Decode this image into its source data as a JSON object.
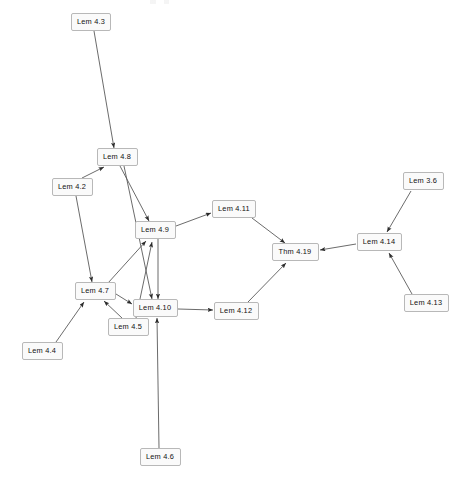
{
  "diagram": {
    "type": "directed-graph",
    "background_color": "#ffffff",
    "node_fill": "#fafafa",
    "node_stroke": "#b8b8b8",
    "edge_color": "#5a5a5a",
    "text_color": "#111111",
    "width": 458,
    "height": 485,
    "nodes": [
      {
        "id": "lem-4-3",
        "label": "Lem 4.3",
        "x": 91,
        "y": 22,
        "w": 40,
        "h": 18
      },
      {
        "id": "lem-4-8",
        "label": "Lem 4.8",
        "x": 117,
        "y": 157,
        "w": 41,
        "h": 18
      },
      {
        "id": "lem-4-2",
        "label": "Lem 4.2",
        "x": 72,
        "y": 187,
        "w": 41,
        "h": 18
      },
      {
        "id": "lem-4-9",
        "label": "Lem 4.9",
        "x": 155,
        "y": 230,
        "w": 41,
        "h": 18
      },
      {
        "id": "lem-4-11",
        "label": "Lem 4.11",
        "x": 234,
        "y": 209,
        "w": 44,
        "h": 18
      },
      {
        "id": "lem-4-7",
        "label": "Lem 4.7",
        "x": 95,
        "y": 291,
        "w": 41,
        "h": 18
      },
      {
        "id": "lem-4-10",
        "label": "Lem 4.10",
        "x": 155,
        "y": 308,
        "w": 45,
        "h": 18
      },
      {
        "id": "lem-4-5",
        "label": "Lem 4.5",
        "x": 128,
        "y": 327,
        "w": 41,
        "h": 18
      },
      {
        "id": "lem-4-12",
        "label": "Lem 4.12",
        "x": 236,
        "y": 311,
        "w": 45,
        "h": 18
      },
      {
        "id": "thm-4-19",
        "label": "Thm 4.19",
        "x": 295,
        "y": 252,
        "w": 47,
        "h": 18
      },
      {
        "id": "lem-4-14",
        "label": "Lem 4.14",
        "x": 379,
        "y": 242,
        "w": 45,
        "h": 18
      },
      {
        "id": "lem-3-6",
        "label": "Lem 3.6",
        "x": 423,
        "y": 181,
        "w": 41,
        "h": 18
      },
      {
        "id": "lem-4-13",
        "label": "Lem 4.13",
        "x": 426,
        "y": 303,
        "w": 45,
        "h": 18
      },
      {
        "id": "lem-4-4",
        "label": "Lem 4.4",
        "x": 42,
        "y": 351,
        "w": 41,
        "h": 18
      },
      {
        "id": "lem-4-6",
        "label": "Lem 4.6",
        "x": 160,
        "y": 457,
        "w": 41,
        "h": 18
      }
    ],
    "edges": [
      {
        "from": "lem-4-3",
        "to": "lem-4-8",
        "x1": 94,
        "y1": 31,
        "x2": 114,
        "y2": 148
      },
      {
        "from": "lem-4-2",
        "to": "lem-4-8",
        "x1": 82,
        "y1": 178,
        "x2": 104,
        "y2": 167
      },
      {
        "from": "lem-4-2",
        "to": "lem-4-7",
        "x1": 76,
        "y1": 196,
        "x2": 92,
        "y2": 282
      },
      {
        "from": "lem-4-8",
        "to": "lem-4-9",
        "x1": 120,
        "y1": 166,
        "x2": 149,
        "y2": 221
      },
      {
        "from": "lem-4-8",
        "to": "lem-4-10",
        "x1": 124,
        "y1": 166,
        "x2": 152,
        "y2": 299
      },
      {
        "from": "lem-4-9",
        "to": "lem-4-11",
        "x1": 176,
        "y1": 226,
        "x2": 211,
        "y2": 213
      },
      {
        "from": "lem-4-9",
        "to": "lem-4-10",
        "x1": 158,
        "y1": 239,
        "x2": 158,
        "y2": 299
      },
      {
        "from": "lem-4-11",
        "to": "thm-4-19",
        "x1": 252,
        "y1": 218,
        "x2": 285,
        "y2": 243
      },
      {
        "from": "lem-4-7",
        "to": "lem-4-9",
        "x1": 108,
        "y1": 283,
        "x2": 146,
        "y2": 241
      },
      {
        "from": "lem-4-7",
        "to": "lem-4-10",
        "x1": 116,
        "y1": 294,
        "x2": 132,
        "y2": 304
      },
      {
        "from": "lem-4-5",
        "to": "lem-4-7",
        "x1": 122,
        "y1": 318,
        "x2": 104,
        "y2": 301
      },
      {
        "from": "lem-4-5",
        "to": "lem-4-9",
        "x1": 136,
        "y1": 318,
        "x2": 152,
        "y2": 242
      },
      {
        "from": "lem-4-4",
        "to": "lem-4-7",
        "x1": 56,
        "y1": 342,
        "x2": 84,
        "y2": 302
      },
      {
        "from": "lem-4-6",
        "to": "lem-4-10",
        "x1": 159,
        "y1": 448,
        "x2": 157,
        "y2": 318
      },
      {
        "from": "lem-4-10",
        "to": "lem-4-12",
        "x1": 178,
        "y1": 309,
        "x2": 213,
        "y2": 310
      },
      {
        "from": "lem-4-12",
        "to": "thm-4-19",
        "x1": 248,
        "y1": 302,
        "x2": 286,
        "y2": 263
      },
      {
        "from": "lem-3-6",
        "to": "lem-4-14",
        "x1": 411,
        "y1": 191,
        "x2": 387,
        "y2": 232
      },
      {
        "from": "lem-4-13",
        "to": "lem-4-14",
        "x1": 412,
        "y1": 294,
        "x2": 389,
        "y2": 253
      },
      {
        "from": "lem-4-14",
        "to": "thm-4-19",
        "x1": 356,
        "y1": 244,
        "x2": 320,
        "y2": 250
      }
    ]
  }
}
